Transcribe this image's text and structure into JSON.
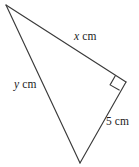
{
  "figure": {
    "type": "right-triangle-diagram",
    "stroke_color": "#3a3a3a",
    "text_color": "#1c1c1c",
    "background_color": "#ffffff",
    "width": 139,
    "height": 167,
    "vertices": [
      {
        "name": "apex-top-left",
        "x": 6,
        "y": 5
      },
      {
        "name": "right-angle-vertex",
        "x": 126,
        "y": 82
      },
      {
        "name": "bottom-vertex",
        "x": 80,
        "y": 163
      }
    ],
    "right_angle": {
      "at_vertex": "right-angle-vertex",
      "marker": "square",
      "size": 10,
      "degrees": 90
    },
    "edges": [
      {
        "name": "hypotenuse-x",
        "label_text": "x cm",
        "variable": "x",
        "unit": "cm",
        "from": "apex-top-left",
        "to": "right-angle-vertex"
      },
      {
        "name": "side-y",
        "label_text": "y cm",
        "variable": "y",
        "unit": "cm",
        "from": "apex-top-left",
        "to": "bottom-vertex"
      },
      {
        "name": "side-five",
        "label_text": "5 cm",
        "value": "5",
        "unit": "cm",
        "from": "right-angle-vertex",
        "to": "bottom-vertex"
      }
    ],
    "labels": {
      "x_variable": "x",
      "x_unit": "cm",
      "y_variable": "y",
      "y_unit": "cm",
      "five_value": "5",
      "five_unit": "cm"
    }
  }
}
